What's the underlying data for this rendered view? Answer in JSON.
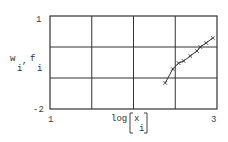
{
  "chart_data": {
    "type": "line",
    "title": "",
    "xlabel": "log[x i]",
    "ylabel": "w i , f i",
    "xlim": [
      1,
      3
    ],
    "ylim": [
      -2,
      1
    ],
    "x_ticks": [
      "1",
      "3"
    ],
    "y_ticks": [
      "1",
      "-2"
    ],
    "grid": true,
    "grid_x": [
      1.5,
      2,
      2.5
    ],
    "grid_y": [
      0,
      -1
    ],
    "legend": null,
    "series": [
      {
        "name": "w_i,f_i",
        "marker": "x",
        "x": [
          2.38,
          2.47,
          2.54,
          2.6,
          2.68,
          2.76,
          2.8,
          2.87,
          2.95
        ],
        "values": [
          -1.16,
          -0.71,
          -0.52,
          -0.45,
          -0.29,
          -0.13,
          0.0,
          0.13,
          0.29
        ]
      }
    ]
  },
  "labels": {
    "y_top": "1",
    "y_bottom": "-2",
    "x_left": "1",
    "x_right": "3",
    "y_axis_main": "w",
    "y_axis_sub1": "i",
    "y_axis_comma": ",",
    "y_axis_f": "f",
    "y_axis_sub2": "i",
    "x_axis_log": "log",
    "x_axis_var": "x",
    "x_axis_sub": "i"
  }
}
